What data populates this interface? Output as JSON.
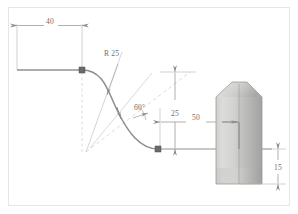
{
  "drawing": {
    "title": "CAD sketch with spline and revolved solid",
    "frame": {
      "border_color": "#e3e3e3",
      "background_color": "#ffffff"
    },
    "colors": {
      "dimension_line": "#8c8c8c",
      "extension_line": "#b8b8b8",
      "construction_line": "#c9c9c9",
      "geometry_line": "#9a9a9a",
      "spline_curve": "#8a8a8a",
      "node_fill": "#6a6a6a",
      "solid_light": "#d8d8d6",
      "solid_mid": "#c4c4c2",
      "solid_dark": "#a8a8a6",
      "text": "#6e6e6e"
    },
    "dimensions": [
      {
        "id": "width-40",
        "label": "40",
        "orientation": "horizontal",
        "location": "top-left"
      },
      {
        "id": "radius-25",
        "label": "R 25",
        "orientation": "leader",
        "location": "upper-middle"
      },
      {
        "id": "angle-60",
        "label": "60°",
        "orientation": "angular",
        "location": "middle"
      },
      {
        "id": "height-25",
        "label": "25",
        "orientation": "vertical",
        "location": "middle-right"
      },
      {
        "id": "length-50",
        "label": "50",
        "orientation": "horizontal",
        "location": "lower-middle"
      },
      {
        "id": "height-15",
        "label": "15",
        "orientation": "vertical",
        "location": "far-right"
      }
    ],
    "nodes": [
      {
        "id": "spline-start-node",
        "x": 82,
        "y": 70
      },
      {
        "id": "spline-end-node",
        "x": 158,
        "y": 149
      }
    ],
    "solid": {
      "id": "revolved-solid",
      "description": "shaded tapered cylindrical body"
    }
  }
}
